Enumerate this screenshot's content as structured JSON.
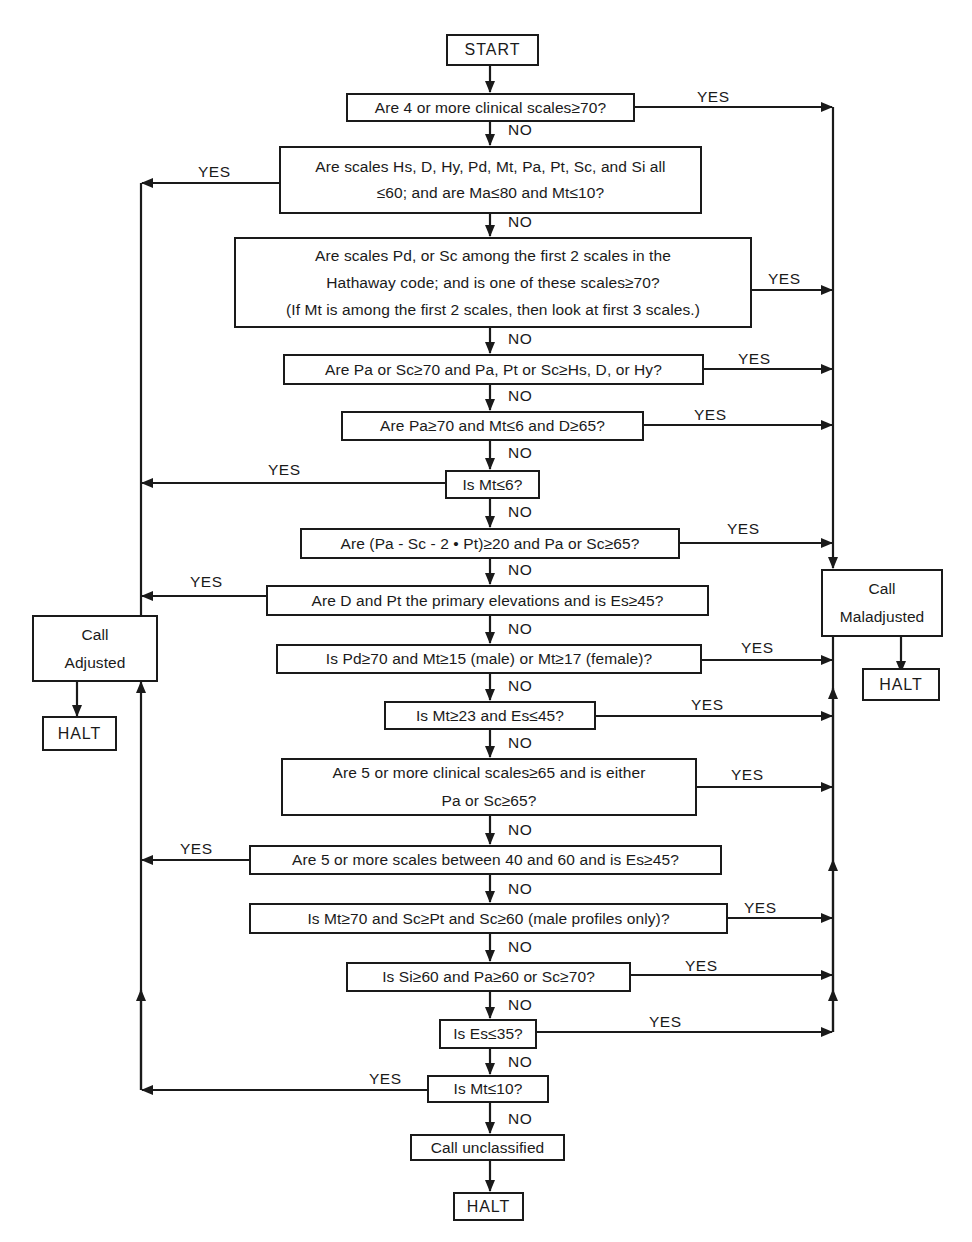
{
  "diagram": {
    "type": "flowchart",
    "start": "START",
    "branch_labels": {
      "yes": "YES",
      "no": "NO"
    },
    "decisions": [
      {
        "id": "q1",
        "lines": [
          "Are 4 or more clinical scales≥70?"
        ],
        "yes_to": "maladjusted"
      },
      {
        "id": "q2",
        "lines": [
          "Are scales Hs, D, Hy, Pd, Mt, Pa, Pt, Sc, and Si all",
          "≤60; and are Ma≤80 and Mt≤10?"
        ],
        "yes_to": "adjusted"
      },
      {
        "id": "q3",
        "lines": [
          "Are scales Pd, or Sc among the first 2 scales in the",
          "Hathaway code; and is one of these scales≥70?",
          "(If Mt is among the first 2 scales, then look at first 3 scales.)"
        ],
        "yes_to": "maladjusted"
      },
      {
        "id": "q4",
        "lines": [
          "Are Pa or Sc≥70 and Pa, Pt or Sc≥Hs, D, or Hy?"
        ],
        "yes_to": "maladjusted"
      },
      {
        "id": "q5",
        "lines": [
          "Are Pa≥70 and Mt≤6 and D≥65?"
        ],
        "yes_to": "maladjusted"
      },
      {
        "id": "q6",
        "lines": [
          "Is Mt≤6?"
        ],
        "yes_to": "adjusted"
      },
      {
        "id": "q7",
        "lines": [
          "Are (Pa - Sc - 2 • Pt)≥20 and Pa or Sc≥65?"
        ],
        "yes_to": "maladjusted"
      },
      {
        "id": "q8",
        "lines": [
          "Are D and Pt the primary elevations and is Es≥45?"
        ],
        "yes_to": "adjusted"
      },
      {
        "id": "q9",
        "lines": [
          "Is Pd≥70 and Mt≥15 (male) or Mt≥17 (female)?"
        ],
        "yes_to": "maladjusted"
      },
      {
        "id": "q10",
        "lines": [
          "Is Mt≥23 and Es≤45?"
        ],
        "yes_to": "maladjusted"
      },
      {
        "id": "q11",
        "lines": [
          "Are 5 or more clinical scales≥65 and is either",
          "Pa or Sc≥65?"
        ],
        "yes_to": "maladjusted"
      },
      {
        "id": "q12",
        "lines": [
          "Are 5 or more scales between 40 and 60 and is Es≥45?"
        ],
        "yes_to": "adjusted"
      },
      {
        "id": "q13",
        "lines": [
          "Is Mt≥70 and Sc≥Pt and Sc≥60 (male profiles only)?"
        ],
        "yes_to": "maladjusted"
      },
      {
        "id": "q14",
        "lines": [
          "Is Si≥60 and Pa≥60 or Sc≥70?"
        ],
        "yes_to": "maladjusted"
      },
      {
        "id": "q15",
        "lines": [
          "Is Es≤35?"
        ],
        "yes_to": "maladjusted"
      },
      {
        "id": "q16",
        "lines": [
          "Is Mt≤10?"
        ],
        "yes_to": "adjusted"
      }
    ],
    "outcomes": {
      "adjusted": {
        "lines": [
          "Call",
          "Adjusted"
        ],
        "halt": "HALT"
      },
      "maladjusted": {
        "lines": [
          "Call",
          "Maladjusted"
        ],
        "halt": "HALT"
      },
      "unclassified": {
        "lines": [
          "Call unclassified"
        ],
        "halt": "HALT"
      }
    },
    "colors": {
      "ink": "#1a1a1a",
      "background": "#ffffff"
    }
  }
}
